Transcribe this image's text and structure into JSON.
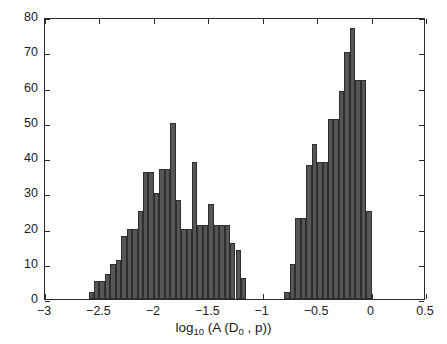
{
  "chart_data": {
    "type": "bar",
    "title": "",
    "xlabel": "log_10 (A (D_0 , p))",
    "xlabel_parts": {
      "base": "log",
      "base_sub": "10",
      "open": " (A (D",
      "arg_sub": "0",
      "close": " , p))"
    },
    "ylabel": "number",
    "xlim": [
      -3,
      0.5
    ],
    "ylim": [
      0,
      80
    ],
    "xticks": [
      -3,
      -2.5,
      -2,
      -1.5,
      -1,
      -0.5,
      0,
      0.5
    ],
    "xtick_labels": [
      "-3",
      "-2.5",
      "-2",
      "-1.5",
      "-1",
      "-0.5",
      "0",
      "0.5"
    ],
    "yticks": [
      0,
      10,
      20,
      30,
      40,
      50,
      60,
      70,
      80
    ],
    "ytick_labels": [
      "0",
      "10",
      "20",
      "30",
      "40",
      "50",
      "60",
      "70",
      "80"
    ],
    "grid": false,
    "legend": false,
    "bar_color": "#565656",
    "bar_edge_color": "#2e2e2e",
    "axes_color": "#2b2b2b",
    "bin_width": 0.05,
    "bins": [
      {
        "x0": -2.6,
        "value": 2
      },
      {
        "x0": -2.55,
        "value": 5
      },
      {
        "x0": -2.5,
        "value": 5
      },
      {
        "x0": -2.45,
        "value": 7
      },
      {
        "x0": -2.4,
        "value": 10
      },
      {
        "x0": -2.35,
        "value": 11
      },
      {
        "x0": -2.3,
        "value": 18
      },
      {
        "x0": -2.25,
        "value": 20
      },
      {
        "x0": -2.2,
        "value": 20
      },
      {
        "x0": -2.15,
        "value": 25
      },
      {
        "x0": -2.1,
        "value": 36
      },
      {
        "x0": -2.05,
        "value": 36
      },
      {
        "x0": -2.0,
        "value": 30
      },
      {
        "x0": -1.95,
        "value": 37
      },
      {
        "x0": -1.9,
        "value": 37
      },
      {
        "x0": -1.85,
        "value": 50
      },
      {
        "x0": -1.8,
        "value": 28
      },
      {
        "x0": -1.75,
        "value": 20
      },
      {
        "x0": -1.7,
        "value": 20
      },
      {
        "x0": -1.65,
        "value": 39
      },
      {
        "x0": -1.6,
        "value": 21
      },
      {
        "x0": -1.55,
        "value": 21
      },
      {
        "x0": -1.5,
        "value": 27
      },
      {
        "x0": -1.45,
        "value": 21
      },
      {
        "x0": -1.4,
        "value": 21
      },
      {
        "x0": -1.35,
        "value": 21
      },
      {
        "x0": -1.3,
        "value": 16
      },
      {
        "x0": -1.25,
        "value": 14
      },
      {
        "x0": -1.2,
        "value": 6
      },
      {
        "x0": -0.8,
        "value": 2
      },
      {
        "x0": -0.75,
        "value": 10
      },
      {
        "x0": -0.7,
        "value": 23
      },
      {
        "x0": -0.65,
        "value": 23
      },
      {
        "x0": -0.6,
        "value": 38
      },
      {
        "x0": -0.55,
        "value": 44
      },
      {
        "x0": -0.5,
        "value": 39
      },
      {
        "x0": -0.45,
        "value": 39
      },
      {
        "x0": -0.4,
        "value": 51
      },
      {
        "x0": -0.35,
        "value": 51
      },
      {
        "x0": -0.3,
        "value": 59
      },
      {
        "x0": -0.25,
        "value": 70
      },
      {
        "x0": -0.2,
        "value": 77
      },
      {
        "x0": -0.15,
        "value": 62
      },
      {
        "x0": -0.1,
        "value": 62
      },
      {
        "x0": -0.05,
        "value": 25
      }
    ]
  }
}
